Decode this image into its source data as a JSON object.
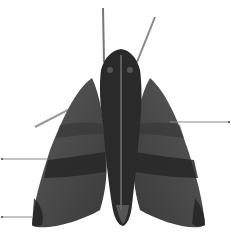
{
  "diagram": {
    "background_color": "#ffffff",
    "body_color": "#2a2a2a",
    "wing_color": "#4a4a4a",
    "band_color": "#262626",
    "line_color": "#8a8a8a",
    "labels": [
      {
        "id": "right-wing-pointer",
        "text": "",
        "x1": 170,
        "y1": 122,
        "x2": 230,
        "y2": 122
      },
      {
        "id": "left-wing-band-pointer",
        "text": "",
        "x1": 2,
        "y1": 159,
        "x2": 48,
        "y2": 159
      },
      {
        "id": "left-wing-tip-pointer",
        "text": "",
        "x1": 2,
        "y1": 217,
        "x2": 32,
        "y2": 217
      }
    ]
  }
}
